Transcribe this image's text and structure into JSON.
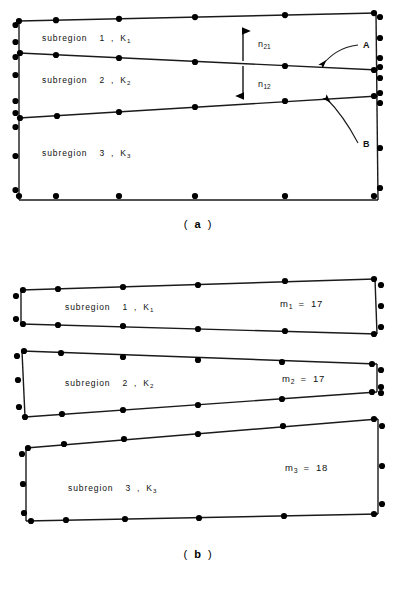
{
  "figure": {
    "type": "finite-element-mesh-diagram",
    "panels": [
      {
        "id": "a",
        "caption": "( a )",
        "caption_letter": "a",
        "description": "Single connected domain divided into three subregions by two internal interfaces",
        "region_labels": [
          {
            "text": "subregion",
            "number": "1",
            "k_symbol": "K",
            "k_index": "1",
            "full": "subregion 1 , K1"
          },
          {
            "text": "subregion",
            "number": "2",
            "k_symbol": "K",
            "k_index": "2",
            "full": "subregion 2 , K2"
          },
          {
            "text": "subregion",
            "number": "3",
            "k_symbol": "K",
            "k_index": "3",
            "full": "subregion 3 , K3"
          }
        ],
        "normal_labels": [
          {
            "symbol": "n",
            "index": "21",
            "full": "n21"
          },
          {
            "symbol": "n",
            "index": "12",
            "full": "n12"
          }
        ],
        "callouts": [
          {
            "label": "A",
            "points_to": "interface-1-2"
          },
          {
            "label": "B",
            "points_to": "interface-2-3"
          }
        ]
      },
      {
        "id": "b",
        "caption": "( b )",
        "caption_letter": "b",
        "description": "The same domain exploded into three separate subregion meshes with node counts",
        "region_labels": [
          {
            "text": "subregion",
            "number": "1",
            "k_symbol": "K",
            "k_index": "1",
            "full": "subregion 1 , K1"
          },
          {
            "text": "subregion",
            "number": "2",
            "k_symbol": "K",
            "k_index": "2",
            "full": "subregion 2 , K2"
          },
          {
            "text": "subregion",
            "number": "3",
            "k_symbol": "K",
            "k_index": "3",
            "full": "subregion 3 , K3"
          }
        ],
        "node_counts": [
          {
            "symbol": "m",
            "index": "1",
            "equals": "=",
            "value": "17",
            "full": "m1 = 17"
          },
          {
            "symbol": "m",
            "index": "2",
            "equals": "=",
            "value": "17",
            "full": "m2 = 17"
          },
          {
            "symbol": "m",
            "index": "3",
            "equals": "=",
            "value": "18",
            "full": "m3 = 18"
          }
        ]
      }
    ],
    "colors": {
      "background": "#ffffff",
      "line": "#1a1a1a",
      "node": "#000000",
      "text": "#111111"
    }
  }
}
